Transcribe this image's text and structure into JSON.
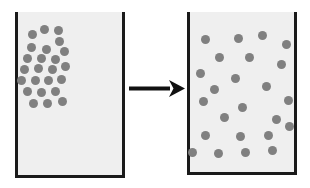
{
  "figure": {
    "background_color": "#ffffff",
    "width": 310,
    "height": 188
  },
  "style": {
    "wall_color": "#1a1a1a",
    "wall_thickness": 3,
    "interior_color": "#efefef",
    "particle_color": "#808080",
    "particle_diameter": 9,
    "arrow_color": "#111111"
  },
  "beakers": [
    {
      "id": "left-beaker",
      "label": "Before diffusion",
      "state": "clustered",
      "x": 15,
      "y": 12,
      "width": 110,
      "height": 166,
      "particle_count": 24,
      "particles": [
        {
          "x": 32,
          "y": 34
        },
        {
          "x": 44,
          "y": 29
        },
        {
          "x": 58,
          "y": 30
        },
        {
          "x": 59,
          "y": 41
        },
        {
          "x": 31,
          "y": 47
        },
        {
          "x": 46,
          "y": 49
        },
        {
          "x": 64,
          "y": 51
        },
        {
          "x": 27,
          "y": 58
        },
        {
          "x": 41,
          "y": 58
        },
        {
          "x": 55,
          "y": 59
        },
        {
          "x": 24,
          "y": 69
        },
        {
          "x": 38,
          "y": 68
        },
        {
          "x": 52,
          "y": 69
        },
        {
          "x": 65,
          "y": 66
        },
        {
          "x": 21,
          "y": 80
        },
        {
          "x": 35,
          "y": 80
        },
        {
          "x": 48,
          "y": 80
        },
        {
          "x": 61,
          "y": 79
        },
        {
          "x": 27,
          "y": 91
        },
        {
          "x": 41,
          "y": 92
        },
        {
          "x": 55,
          "y": 91
        },
        {
          "x": 33,
          "y": 103
        },
        {
          "x": 47,
          "y": 103
        },
        {
          "x": 62,
          "y": 101
        }
      ]
    },
    {
      "id": "right-beaker",
      "label": "After diffusion",
      "state": "dispersed",
      "x": 187,
      "y": 12,
      "width": 110,
      "height": 163,
      "particle_count": 24,
      "particles": [
        {
          "x": 205,
          "y": 39
        },
        {
          "x": 238,
          "y": 38
        },
        {
          "x": 262,
          "y": 35
        },
        {
          "x": 286,
          "y": 44
        },
        {
          "x": 219,
          "y": 57
        },
        {
          "x": 249,
          "y": 57
        },
        {
          "x": 281,
          "y": 64
        },
        {
          "x": 200,
          "y": 73
        },
        {
          "x": 235,
          "y": 78
        },
        {
          "x": 214,
          "y": 89
        },
        {
          "x": 266,
          "y": 86
        },
        {
          "x": 203,
          "y": 101
        },
        {
          "x": 288,
          "y": 100
        },
        {
          "x": 242,
          "y": 107
        },
        {
          "x": 224,
          "y": 117
        },
        {
          "x": 276,
          "y": 119
        },
        {
          "x": 289,
          "y": 126
        },
        {
          "x": 205,
          "y": 135
        },
        {
          "x": 240,
          "y": 136
        },
        {
          "x": 268,
          "y": 135
        },
        {
          "x": 192,
          "y": 152
        },
        {
          "x": 218,
          "y": 153
        },
        {
          "x": 245,
          "y": 152
        },
        {
          "x": 272,
          "y": 150
        }
      ]
    }
  ],
  "arrow": {
    "id": "process-arrow",
    "label": "transforms into",
    "direction": "right",
    "x": 129,
    "y": 88,
    "length": 56,
    "shaft_thickness": 4,
    "head_length": 16,
    "head_width": 17
  }
}
